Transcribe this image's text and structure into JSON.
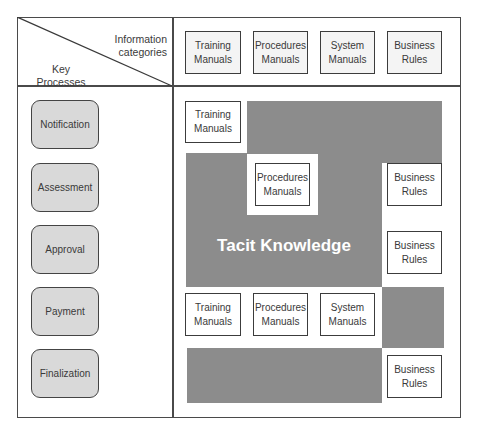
{
  "corner": {
    "columns_label_line1": "Information",
    "columns_label_line2": "categories",
    "rows_label_line1": "Key",
    "rows_label_line2": "Processes"
  },
  "header_categories": [
    {
      "line1": "Training",
      "line2": "Manuals"
    },
    {
      "line1": "Procedures",
      "line2": "Manuals"
    },
    {
      "line1": "System",
      "line2": "Manuals"
    },
    {
      "line1": "Business",
      "line2": "Rules"
    }
  ],
  "key_processes": [
    {
      "label": "Notification"
    },
    {
      "label": "Assessment"
    },
    {
      "label": "Approval"
    },
    {
      "label": "Payment"
    },
    {
      "label": "Finalization"
    }
  ],
  "matrix": {
    "notification": [
      {
        "line1": "Training",
        "line2": "Manuals"
      }
    ],
    "assessment": [
      {
        "line1": "Procedures",
        "line2": "Manuals"
      },
      {
        "line1": "Business",
        "line2": "Rules"
      }
    ],
    "approval": [
      {
        "line1": "Business",
        "line2": "Rules"
      }
    ],
    "payment": [
      {
        "line1": "Training",
        "line2": "Manuals"
      },
      {
        "line1": "Procedures",
        "line2": "Manuals"
      },
      {
        "line1": "System",
        "line2": "Manuals"
      }
    ],
    "finalization": [
      {
        "line1": "Business",
        "line2": "Rules"
      }
    ]
  },
  "tacit_label": "Tacit Knowledge",
  "colors": {
    "tacit_fill": "#8c8c8c",
    "process_fill": "#d9d9d9",
    "border": "#3c3c3c"
  }
}
